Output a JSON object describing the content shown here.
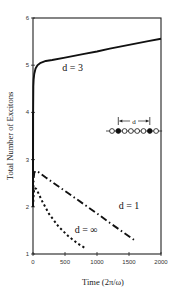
{
  "chart_data": {
    "type": "line",
    "title": "",
    "xlabel": "Time (2π/ω)",
    "ylabel": "Total Number of Excitons",
    "xlim": [
      0,
      2000
    ],
    "ylim": [
      1,
      6
    ],
    "xticks": [
      0,
      500,
      1000,
      1500,
      2000
    ],
    "xtick_labels": [
      "0",
      "500",
      "1000",
      "1500",
      "2000"
    ],
    "yticks": [
      1,
      2,
      3,
      4,
      5,
      6
    ],
    "ytick_labels": [
      "1",
      "2",
      "3",
      "4",
      "5",
      "6"
    ],
    "grid": false,
    "legend": "inline labels",
    "series": [
      {
        "name": "d = 3",
        "style": "solid",
        "x": [
          0,
          2,
          5,
          10,
          20,
          40,
          70,
          120,
          200,
          300,
          500,
          800,
          1000,
          1200,
          1500,
          1800,
          2000
        ],
        "values": [
          2.0,
          4.0,
          4.55,
          4.7,
          4.82,
          4.93,
          5.0,
          5.05,
          5.09,
          5.11,
          5.16,
          5.24,
          5.29,
          5.35,
          5.43,
          5.51,
          5.56
        ]
      },
      {
        "name": "d = 1",
        "style": "dash-dot",
        "x": [
          0,
          10,
          20,
          40,
          80,
          200,
          400,
          600,
          800,
          1000,
          1200,
          1400,
          1600
        ],
        "values": [
          2.0,
          2.6,
          2.72,
          2.76,
          2.74,
          2.62,
          2.43,
          2.24,
          2.05,
          1.86,
          1.66,
          1.47,
          1.28
        ]
      },
      {
        "name": "d = ∞",
        "style": "dotted",
        "x": [
          0,
          10,
          25,
          50,
          80,
          150,
          250,
          400,
          550,
          700,
          820
        ],
        "values": [
          2.0,
          2.3,
          2.4,
          2.38,
          2.3,
          2.1,
          1.85,
          1.58,
          1.38,
          1.22,
          1.12
        ]
      }
    ],
    "annotations": [
      {
        "text": "d = 3",
        "x": 620,
        "y": 4.88
      },
      {
        "text": "d = 1",
        "x": 1500,
        "y": 1.95
      },
      {
        "text": "d = ∞",
        "x": 830,
        "y": 1.45
      }
    ],
    "inset": {
      "description": "chain of sites: open circles with two filled circles separated by distance d",
      "label": "d",
      "sites": [
        "open",
        "filled",
        "open",
        "open",
        "open",
        "open",
        "filled",
        "open"
      ]
    }
  }
}
